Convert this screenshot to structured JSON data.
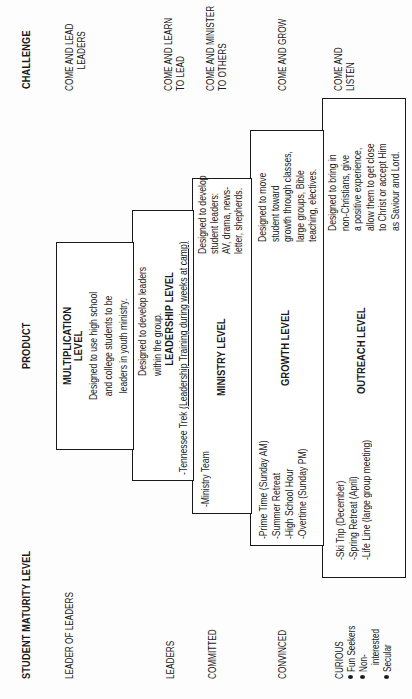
{
  "headers": {
    "maturity": "STUDENT MATURITY LEVEL",
    "product": "PRODUCT",
    "challenge": "CHALLENGE"
  },
  "maturity_levels": {
    "leader_of_leaders": "LEADER OF LEADERS",
    "leaders": "LEADERS",
    "committed": "COMMITTED",
    "convinced": "CONVINCED",
    "curious": {
      "title": "CURIOUS",
      "bullets": [
        "Fun Seekers",
        "Non-",
        "interested",
        "Secular"
      ]
    }
  },
  "challenges": {
    "lead_leaders": [
      "COME AND LEAD",
      "LEADERS"
    ],
    "learn_to_lead": [
      "COME AND LEARN",
      "TO LEAD"
    ],
    "minister": [
      "COME AND MINISTER",
      "TO OTHERS"
    ],
    "grow": [
      "COME AND GROW"
    ],
    "listen": [
      "COME AND",
      "LISTEN"
    ]
  },
  "levels": {
    "multiplication": {
      "title": [
        "MULTIPLICATION",
        "LEVEL"
      ],
      "description": [
        "Designed to use high school",
        "and college students to be",
        "leaders in youth ministry."
      ]
    },
    "leadership": {
      "description": [
        "Designed to develop leaders",
        "within the group."
      ],
      "title": "LEADERSHIP LEVEL",
      "program_prefix": "-Tennessee Trek ",
      "program_detail": "(Leadership Training during weeks at camp)"
    },
    "ministry": {
      "program": "-Ministry Team",
      "title": "MINISTRY LEVEL",
      "description": [
        "Designed to develop",
        "student leaders:",
        "AV, drama, news-",
        "letter, shepherds."
      ]
    },
    "growth": {
      "programs": [
        "-Prime Time (Sunday AM)",
        "-Summer Retreat",
        "-High School Hour",
        "-Overtime (Sunday PM)"
      ],
      "title": "GROWTH LEVEL",
      "description": [
        "Designed to move",
        "student toward",
        "growth through classes,",
        "large groups, Bible",
        "teaching, electives."
      ]
    },
    "outreach": {
      "programs": [
        "-Ski Trip (December)",
        "-Spring Retreat (April)",
        "-Life Line (large group meeting)"
      ],
      "title": "OUTREACH LEVEL",
      "description": [
        "Designed to bring in",
        "non-Christians, give",
        "a positive experience,",
        "allow them to get close",
        "to Christ or accept Him",
        "as Saviour and Lord."
      ]
    }
  }
}
